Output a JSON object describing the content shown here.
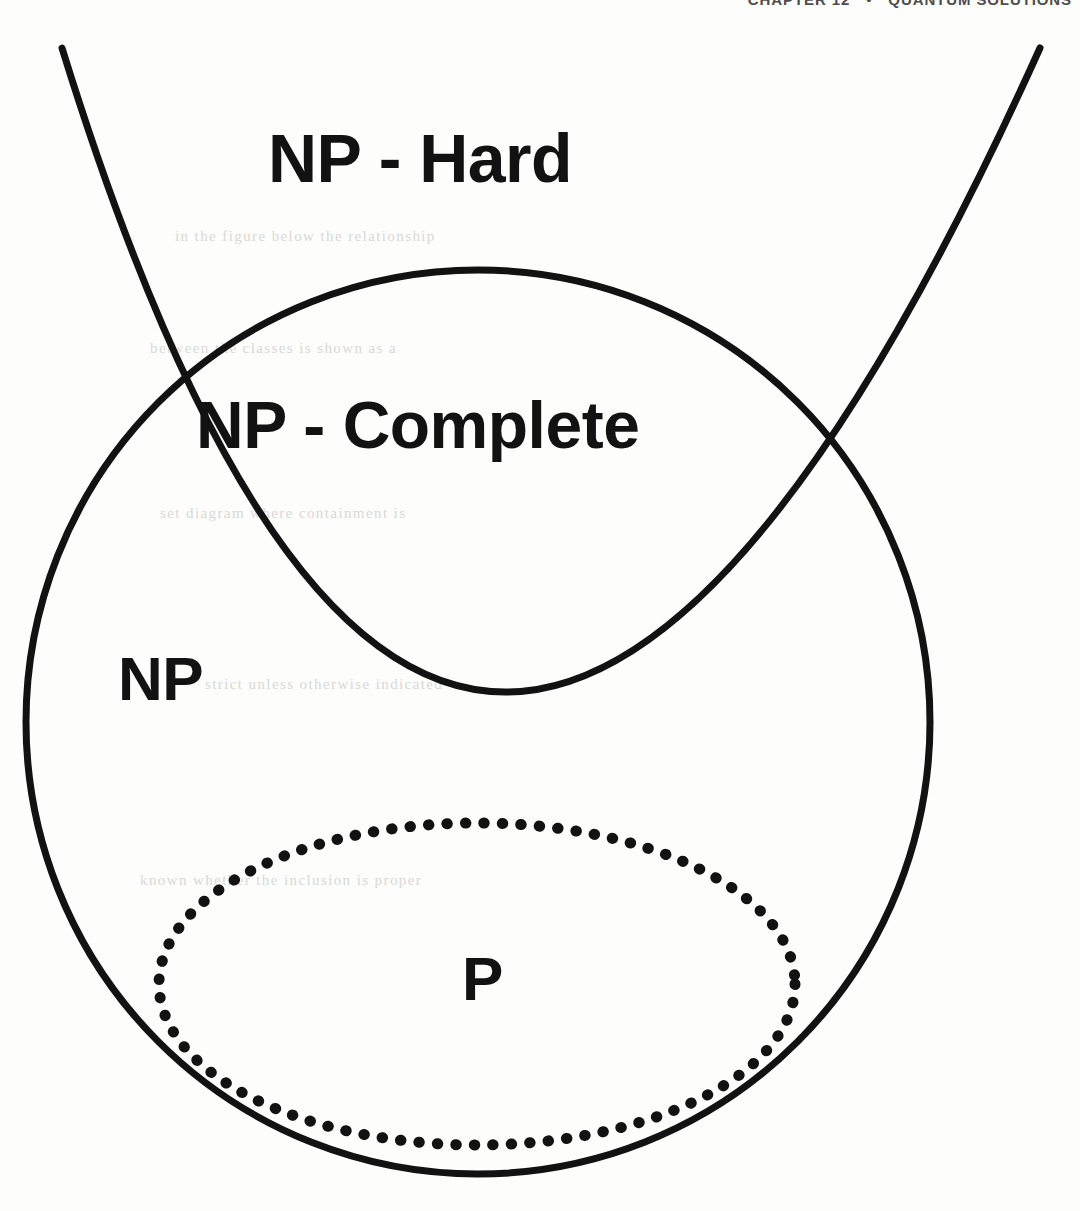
{
  "page": {
    "background_color": "#fdfdfc",
    "ink_color": "#121212",
    "width": 1080,
    "height": 1211
  },
  "header": {
    "chapter": "CHAPTER 12",
    "separator": "•",
    "section_title": "QUANTUM SOLUTIONS",
    "color": "#4d4d4d"
  },
  "ghost_text": {
    "line1": "in the figure below the relationship",
    "line2": "between the classes is shown as a",
    "line3": "set diagram where containment is",
    "line4": "strict unless otherwise indicated",
    "line5": "known whether the inclusion is proper"
  },
  "diagram": {
    "type": "venn-set-diagram",
    "shapes": [
      {
        "name": "np-circle",
        "kind": "circle",
        "stroke": "#121212",
        "stroke_width": 7,
        "stroke_style": "solid",
        "fill": "none",
        "cx": 478,
        "cy": 722,
        "r": 452
      },
      {
        "name": "np-hard-parabola",
        "kind": "parabola",
        "stroke": "#121212",
        "stroke_width": 7,
        "stroke_style": "solid",
        "fill": "none",
        "vertex_x": 460,
        "vertex_y": 692,
        "left_end_x": 62,
        "left_end_y": 48,
        "right_end_x": 1040,
        "right_end_y": 48
      },
      {
        "name": "p-ellipse",
        "kind": "ellipse",
        "stroke": "#121212",
        "stroke_width": 11,
        "stroke_style": "dotted",
        "fill": "none",
        "cx": 477,
        "cy": 984,
        "rx": 318,
        "ry": 161
      }
    ],
    "intersections": [
      {
        "name": "left-intersection",
        "x": 182,
        "y": 402
      },
      {
        "name": "right-intersection",
        "x": 817,
        "y": 440
      }
    ],
    "labels": {
      "np_hard": "NP - Hard",
      "np_complete": "NP - Complete",
      "np": "NP",
      "p": "P"
    }
  }
}
